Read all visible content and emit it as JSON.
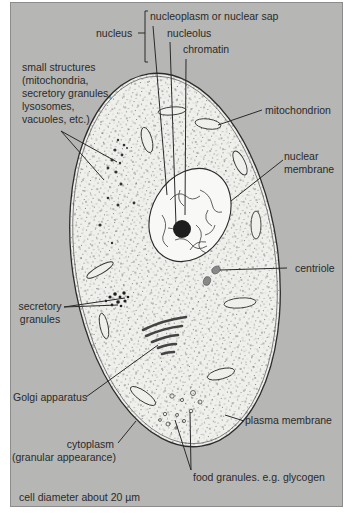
{
  "figure": {
    "caption": "cell diameter about 20 µm",
    "colors": {
      "background": "#b6b6b4",
      "cell_fill": "#efefec",
      "nucleus_fill": "#f8f8f6",
      "line": "#2a2a2a",
      "nucleolus": "#1e1e1e"
    },
    "labels": {
      "nucleus": "nucleus",
      "nucleoplasm": "nucleoplasm or nuclear sap",
      "nucleolus": "nucleolus",
      "chromatin": "chromatin",
      "small_structures": [
        "small structures",
        "(mitochondria,",
        "secretory granules,",
        "lysosomes,",
        "vacuoles, etc.)"
      ],
      "mitochondrion": "mitochondrion",
      "nuclear_membrane": [
        "nuclear",
        "membrane"
      ],
      "centriole": "centriole",
      "secretory_granules": [
        "secretory",
        "granules"
      ],
      "golgi": "Golgi apparatus",
      "plasma_membrane": "plasma membrane",
      "cytoplasm": [
        "cytoplasm",
        "(granular appearance)"
      ],
      "food_granules": "food granules. e.g. glycogen"
    }
  }
}
